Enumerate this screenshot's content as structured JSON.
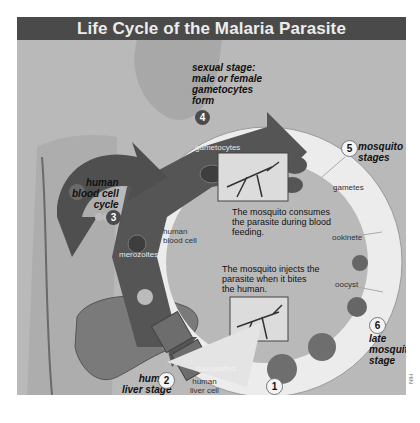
{
  "title": "Life Cycle of the Malaria Parasite",
  "credit": "NIH",
  "stages": [
    {
      "number": "1",
      "label": "sporozoites"
    },
    {
      "number": "2",
      "label": "human liver stage"
    },
    {
      "number": "3",
      "label": "human blood cell cycle"
    },
    {
      "number": "4",
      "label": "sexual stage: male or female gametocytes form"
    },
    {
      "number": "5",
      "label": "mosquito stages"
    },
    {
      "number": "6",
      "label": "late mosquito stage"
    }
  ],
  "labels": {
    "sexual_stage_line1": "sexual stage:",
    "sexual_stage_line2": "male or female",
    "sexual_stage_line3": "gametocytes",
    "sexual_stage_line4": "form",
    "mosquito_stages_line1": "mosquito",
    "mosquito_stages_line2": "stages",
    "late_stage_line1": "late",
    "late_stage_line2": "mosquito",
    "late_stage_line3": "stage",
    "blood_cycle_line1": "human",
    "blood_cycle_line2": "blood cell",
    "blood_cycle_line3": "cycle",
    "liver_stage_line1": "human",
    "liver_stage_line2": "liver stage",
    "gametocytes": "gametocytes",
    "gametes": "gametes",
    "ookinete": "ookinete",
    "oocyst": "oocyst",
    "sporozoites": "sporozoites",
    "merozoites": "merozoites",
    "human_blood_cell_line1": "human",
    "human_blood_cell_line2": "blood cell",
    "human_liver_cell_line1": "human",
    "human_liver_cell_line2": "liver cell",
    "consumes_line1": "The mosquito consumes",
    "consumes_line2": "the parasite during blood",
    "consumes_line3": "feeding.",
    "injects_line1": "The mosquito injects the",
    "injects_line2": "parasite when it bites",
    "injects_line3": "the human."
  },
  "colors": {
    "title_bar": "#4a4a4a",
    "background": "#b9b9b9",
    "arrow": "#555555",
    "ring": "#ececec",
    "liver": "#7a7a7a"
  }
}
